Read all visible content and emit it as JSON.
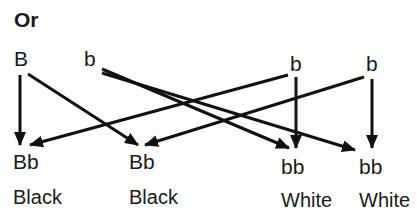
{
  "title": "Or",
  "parents": {
    "p1": [
      "B",
      "b"
    ],
    "p2": [
      "b",
      "b"
    ]
  },
  "offspring": [
    {
      "genotype": "Bb",
      "phenotype": "Black"
    },
    {
      "genotype": "Bb",
      "phenotype": "Black"
    },
    {
      "genotype": "bb",
      "phenotype": "White"
    },
    {
      "genotype": "bb",
      "phenotype": "White"
    }
  ],
  "colors": {
    "line": "#111111",
    "text": "#1a1a1a"
  }
}
